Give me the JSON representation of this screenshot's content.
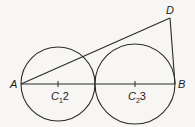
{
  "diagram": {
    "points": {
      "A": {
        "label": "A",
        "x": 21,
        "y": 84
      },
      "B": {
        "label": "B",
        "x": 175,
        "y": 84
      },
      "D": {
        "label": "D",
        "x": 170,
        "y": 18
      }
    },
    "circles": [
      {
        "center_label": "C",
        "center_sub": "1",
        "radius_label": "2",
        "cx": 58,
        "cy": 84,
        "r": 37
      },
      {
        "center_label": "C",
        "center_sub": "2",
        "radius_label": "3",
        "cx": 135,
        "cy": 84,
        "r": 40
      }
    ],
    "segments": [
      [
        "A",
        "B"
      ],
      [
        "A",
        "D"
      ],
      [
        "D",
        "B"
      ]
    ],
    "stroke_color": "#2a2a2a"
  }
}
